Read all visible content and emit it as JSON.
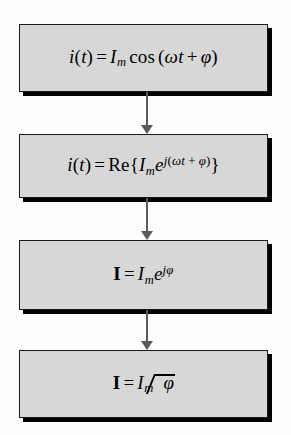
{
  "diagram": {
    "background_color": "#fdfdfd",
    "box_fill_color": "#d7d7d7",
    "box_border_color": "#1a1a1a",
    "shadow_color": "#000000",
    "arrow_color": "#5a5a5a",
    "nodes": [
      {
        "id": "time-domain-cosine",
        "formula_text": "i(t) = Im cos (ωt + φ)",
        "parts": {
          "lhs_func": "i",
          "lhs_open": "(",
          "lhs_arg": "t",
          "lhs_close": ")",
          "equals": "=",
          "amplitude": "I",
          "amplitude_sub": "m",
          "cos": "cos",
          "open_paren": "(",
          "omega": "ω",
          "time": "t",
          "plus": "+",
          "phase": "φ",
          "close_paren": ")"
        }
      },
      {
        "id": "real-part-exponential",
        "formula_text": "i(t) = Re{Im e^{j(ωt + φ)}}",
        "parts": {
          "lhs_func": "i",
          "lhs_open": "(",
          "lhs_arg": "t",
          "lhs_close": ")",
          "equals": "=",
          "re": "Re",
          "brace_open": "{",
          "amplitude": "I",
          "amplitude_sub": "m",
          "e": "e",
          "exp_j": "j",
          "exp_open": "(",
          "exp_omega": "ω",
          "exp_t": "t",
          "exp_plus": "+",
          "exp_phase": "φ",
          "exp_close": ")",
          "brace_close": "}"
        }
      },
      {
        "id": "phasor-exponential",
        "formula_text": "I = Im e^{jφ}",
        "parts": {
          "phasor": "I",
          "equals": "=",
          "amplitude": "I",
          "amplitude_sub": "m",
          "e": "e",
          "exp_j": "j",
          "exp_phase": "φ"
        }
      },
      {
        "id": "phasor-angle-notation",
        "formula_text": "I = Im ∠φ",
        "parts": {
          "phasor": "I",
          "equals": "=",
          "amplitude": "I",
          "amplitude_sub": "m",
          "angle_phase": "φ"
        }
      }
    ],
    "connectors": [
      {
        "id": "arrow-1-to-2",
        "icon": "down-arrow-icon"
      },
      {
        "id": "arrow-2-to-3",
        "icon": "down-arrow-icon"
      },
      {
        "id": "arrow-3-to-4",
        "icon": "down-arrow-icon"
      }
    ]
  }
}
